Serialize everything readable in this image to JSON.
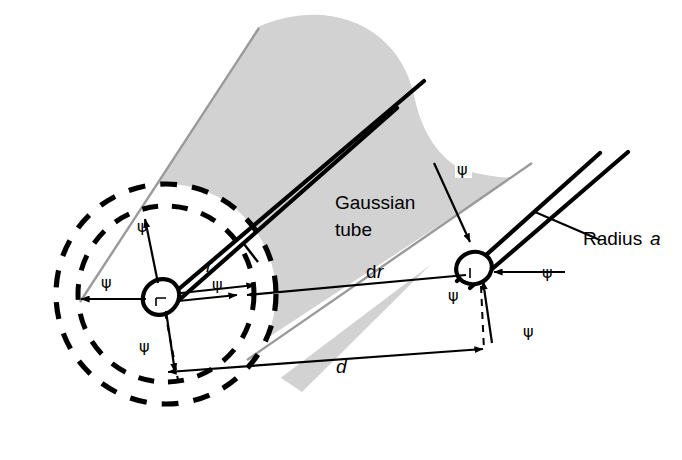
{
  "figure": {
    "background_color": "#ffffff",
    "ink_color": "#000000",
    "shade_color": "#d2d2d2",
    "shade_edge_color": "#9a9a9a"
  },
  "labels": {
    "gaussian_line1": "Gaussian",
    "gaussian_line2": "tube",
    "dr_d": "d",
    "dr_r": "r",
    "radius_text": "Radius",
    "radius_symbol": "a",
    "distance_d": "d",
    "radial_r": "r"
  },
  "flux_symbols": [
    {
      "id": "psi-left-top",
      "glyph": "ψ",
      "x": 137,
      "y": 232
    },
    {
      "id": "psi-left-west",
      "glyph": "ψ",
      "x": 101,
      "y": 288
    },
    {
      "id": "psi-left-east",
      "glyph": "ψ",
      "x": 212,
      "y": 290
    },
    {
      "id": "psi-left-bottom",
      "glyph": "ψ",
      "x": 139,
      "y": 352
    },
    {
      "id": "psi-tube-top",
      "glyph": "ψ",
      "x": 462,
      "y": 172
    },
    {
      "id": "psi-right-east",
      "glyph": "ψ",
      "x": 542,
      "y": 278
    },
    {
      "id": "psi-right-bottom",
      "glyph": "ψ",
      "x": 523,
      "y": 337
    },
    {
      "id": "psi-right-lower",
      "glyph": "ψ",
      "x": 448,
      "y": 301
    }
  ],
  "geometry": {
    "left_wire_circle": {
      "cx": 161,
      "cy": 297,
      "rx": 19,
      "ry": 17
    },
    "right_wire_circle": {
      "cx": 474,
      "cy": 268,
      "rx": 19,
      "ry": 17
    },
    "inner_dashed_circle": {
      "cx": 166,
      "cy": 294,
      "r": 88
    },
    "outer_dashed_circle": {
      "cx": 166,
      "cy": 294,
      "r": 110
    },
    "radial_arrow_count": 4,
    "tube_axis_angle_deg": -41
  }
}
